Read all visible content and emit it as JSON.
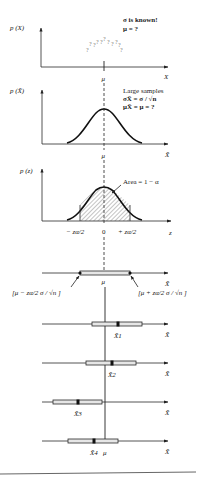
{
  "panels": {
    "population": {
      "ylabel": "p (X)",
      "xlabel": "X",
      "note_line1": "σ is known!",
      "note_line2": "μ = ?",
      "question_marks": [
        "?",
        "?",
        "?",
        "?",
        "?",
        "?",
        "?",
        "?",
        "?",
        "?",
        "?"
      ],
      "tick_label": "μ"
    },
    "sampling": {
      "ylabel": "p (X̄)",
      "xlabel": "X̄",
      "note_line1": "Large samples",
      "note_line2": "σX̄ = σ / √n",
      "note_line3": "μX̄ = μ = ?",
      "tick_label": "μ"
    },
    "standard_normal": {
      "ylabel": "p (z)",
      "xlabel": "z",
      "area_label": "Area = 1 − α",
      "tick_left": "− zα/2",
      "tick_center": "0",
      "tick_right": "+ zα/2"
    },
    "interval": {
      "xlabel": "X̄",
      "center_label": "μ",
      "left_bound": "[μ − zα/2 σ / √n ]",
      "right_bound": "[μ + zα/2 σ / √n ]"
    },
    "samples": [
      {
        "label": "X̄1",
        "xlabel": "X̄"
      },
      {
        "label": "X̄2",
        "xlabel": "X̄"
      },
      {
        "label": "X̄3",
        "xlabel": "X̄"
      },
      {
        "label": "X̄4",
        "xlabel": "X̄",
        "mu_label": "μ"
      }
    ]
  },
  "colors": {
    "ink": "#222222",
    "bar_fill": "#e6e6e6",
    "hatch": "#555555"
  }
}
